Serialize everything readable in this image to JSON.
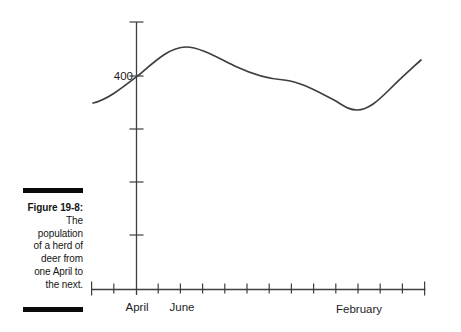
{
  "figure": {
    "label": "Figure 19-8:",
    "caption_lines": [
      "The",
      "population",
      "of a herd of",
      "deer from",
      "one April to",
      "the next."
    ],
    "caption_full": "The population of a herd of deer from one April to the next."
  },
  "chart_data": {
    "type": "line",
    "title": "Figure 19-8: The population of a herd of deer from one April to the next.",
    "xlabel": "",
    "ylabel": "",
    "x_axis_unit": "month",
    "visible_x_tick_labels": [
      "April",
      "June",
      "February"
    ],
    "visible_y_tick_labels": [
      "400"
    ],
    "ylim": [
      0,
      500
    ],
    "y_tick_interval": 100,
    "x_tick_interval_months": 1,
    "x": [
      "April",
      "May",
      "June",
      "July",
      "August",
      "September",
      "October",
      "November",
      "December",
      "January",
      "February",
      "March",
      "April (next)"
    ],
    "series": [
      {
        "name": "Deer population",
        "values": [
          400,
          430,
          450,
          440,
          425,
          410,
          395,
          385,
          370,
          350,
          335,
          360,
          400
        ]
      }
    ],
    "grid": false,
    "legend": false
  },
  "plot": {
    "ink": "#3f3f3f",
    "text_color": "#1c1c1c",
    "x_axis": {
      "y": 289.5,
      "x1": 91,
      "x2": 425.4,
      "ticks": [
        91.6,
        113.8,
        158.2,
        180.4,
        202.6,
        224.8,
        247,
        269.2,
        291.4,
        313.6,
        335.8,
        358,
        380.2,
        402.4,
        424.6
      ],
      "tick_half": 5,
      "end_tick_half": 7
    },
    "y_axis": {
      "x": 136.5,
      "y1": 22,
      "y2": 295,
      "ticks": [
        22,
        76,
        129,
        182,
        235
      ],
      "tick_half": 7
    },
    "curve_path": "M 93,103 C 107,100 122,88 140,74 C 155,61 170,47 186,47 C 200,47 218,58 237,67 C 252,74 268,79 284,80 C 302,82 318,92 334,100 C 343,105 348,110 357,110 C 368,110 378,101 390,89 C 402,77 410,70 421,60",
    "curve_width": 1.7,
    "axis_width": 1.3,
    "labels": {
      "y400": {
        "name": "y-tick-label-400",
        "text": "400",
        "x": 133,
        "y": 80,
        "anchor": "end",
        "size": 11.5
      },
      "april": {
        "name": "x-tick-label-april",
        "text": "April",
        "x": 137,
        "y": 311,
        "anchor": "middle",
        "size": 11.5
      },
      "june": {
        "name": "x-tick-label-june",
        "text": "June",
        "x": 182,
        "y": 311,
        "anchor": "middle",
        "size": 11.5
      },
      "february": {
        "name": "x-tick-label-february",
        "text": "February",
        "x": 359,
        "y": 313,
        "anchor": "middle",
        "size": 11.5
      }
    }
  }
}
